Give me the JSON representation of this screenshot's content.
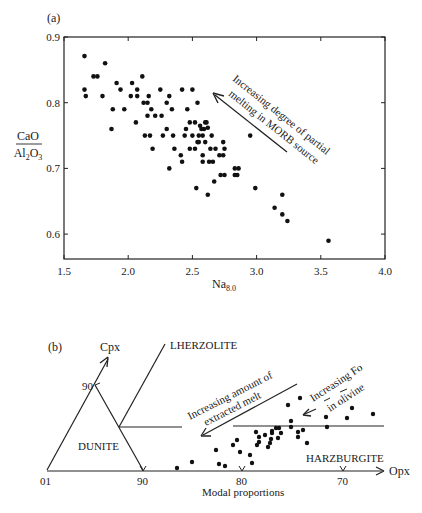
{
  "chart_data": [
    {
      "panel": "(a)",
      "type": "scatter",
      "title": "",
      "xlabel": "Na8.0",
      "xlabel_main": "Na",
      "xlabel_sub": "8.0",
      "ylabel": "CaO/Al2O3",
      "ylabel_num": "CaO",
      "ylabel_den_main": "Al",
      "ylabel_den_sub1": "2",
      "ylabel_den_mid": "O",
      "ylabel_den_sub2": "3",
      "xlim": [
        1.5,
        4.0
      ],
      "ylim": [
        0.56,
        0.9
      ],
      "xticks": [
        "1.5",
        "2.0",
        "2.5",
        "3.0",
        "3.5",
        "4.0"
      ],
      "yticks": [
        "0.9",
        "0.8",
        "0.7",
        "0.6"
      ],
      "grid": false,
      "annotation": {
        "line1": "Increasing degree of partial",
        "line2": "melting in MORB source",
        "arrow_direction": "up-left"
      },
      "points": [
        [
          1.66,
          0.871
        ],
        [
          1.66,
          0.82
        ],
        [
          1.67,
          0.81
        ],
        [
          1.82,
          0.86
        ],
        [
          1.73,
          0.84
        ],
        [
          1.76,
          0.84
        ],
        [
          1.8,
          0.81
        ],
        [
          1.88,
          0.79
        ],
        [
          1.87,
          0.76
        ],
        [
          1.91,
          0.83
        ],
        [
          1.94,
          0.82
        ],
        [
          1.97,
          0.79
        ],
        [
          2.02,
          0.81
        ],
        [
          2.03,
          0.83
        ],
        [
          2.07,
          0.82
        ],
        [
          2.07,
          0.81
        ],
        [
          2.11,
          0.84
        ],
        [
          2.12,
          0.8
        ],
        [
          2.06,
          0.77
        ],
        [
          2.15,
          0.8
        ],
        [
          2.16,
          0.81
        ],
        [
          2.18,
          0.79
        ],
        [
          2.15,
          0.78
        ],
        [
          2.21,
          0.78
        ],
        [
          2.25,
          0.82
        ],
        [
          2.26,
          0.78
        ],
        [
          2.3,
          0.8
        ],
        [
          2.32,
          0.81
        ],
        [
          2.34,
          0.79
        ],
        [
          2.13,
          0.75
        ],
        [
          2.17,
          0.75
        ],
        [
          2.19,
          0.73
        ],
        [
          2.27,
          0.75
        ],
        [
          2.3,
          0.76
        ],
        [
          2.35,
          0.75
        ],
        [
          2.36,
          0.73
        ],
        [
          2.42,
          0.82
        ],
        [
          2.41,
          0.72
        ],
        [
          2.46,
          0.79
        ],
        [
          2.45,
          0.76
        ],
        [
          2.44,
          0.75
        ],
        [
          2.48,
          0.77
        ],
        [
          2.5,
          0.82
        ],
        [
          2.54,
          0.8
        ],
        [
          2.32,
          0.7
        ],
        [
          2.42,
          0.71
        ],
        [
          2.58,
          0.71
        ],
        [
          2.63,
          0.71
        ],
        [
          2.53,
          0.67
        ],
        [
          2.62,
          0.66
        ],
        [
          2.5,
          0.75
        ],
        [
          2.52,
          0.77
        ],
        [
          2.55,
          0.74
        ],
        [
          2.57,
          0.76
        ],
        [
          2.55,
          0.75
        ],
        [
          2.58,
          0.75
        ],
        [
          2.6,
          0.74
        ],
        [
          2.48,
          0.73
        ],
        [
          2.52,
          0.73
        ],
        [
          2.58,
          0.72
        ],
        [
          2.54,
          0.74
        ],
        [
          2.56,
          0.765
        ],
        [
          2.6,
          0.77
        ],
        [
          2.62,
          0.762
        ],
        [
          2.59,
          0.76
        ],
        [
          2.61,
          0.77
        ],
        [
          2.65,
          0.75
        ],
        [
          2.74,
          0.74
        ],
        [
          2.75,
          0.73
        ],
        [
          2.64,
          0.73
        ],
        [
          2.68,
          0.73
        ],
        [
          2.71,
          0.72
        ],
        [
          2.74,
          0.72
        ],
        [
          2.66,
          0.71
        ],
        [
          2.83,
          0.7
        ],
        [
          2.86,
          0.7
        ],
        [
          2.83,
          0.69
        ],
        [
          2.85,
          0.69
        ],
        [
          2.72,
          0.69
        ],
        [
          2.75,
          0.69
        ],
        [
          2.67,
          0.68
        ],
        [
          2.95,
          0.75
        ],
        [
          2.99,
          0.67
        ],
        [
          3.2,
          0.66
        ],
        [
          3.14,
          0.64
        ],
        [
          3.2,
          0.63
        ],
        [
          3.24,
          0.62
        ],
        [
          3.56,
          0.59
        ]
      ]
    },
    {
      "panel": "(b)",
      "type": "scatter",
      "title": "",
      "xlabel": "Modal proportions",
      "axis_label_x": "Opx",
      "axis_label_y": "Cpx",
      "origin_label": "01",
      "base_ticks": [
        "90",
        "80",
        "70"
      ],
      "cpx_tick": "90",
      "fields": [
        "LHERZOLITE",
        "DUNITE",
        "HARZBURGITE"
      ],
      "annotations": {
        "melt_line1": "Increasing amount of",
        "melt_line2": "extracted melt",
        "fo_line1": "Increasing Fo",
        "fo_line2": "in olivine"
      },
      "points_px": [
        [
          177,
          468
        ],
        [
          192,
          462
        ],
        [
          216,
          450
        ],
        [
          219,
          464
        ],
        [
          225,
          466
        ],
        [
          233,
          445
        ],
        [
          237,
          440
        ],
        [
          240,
          452
        ],
        [
          250,
          455
        ],
        [
          252,
          463
        ],
        [
          256,
          432
        ],
        [
          259,
          437
        ],
        [
          257,
          445
        ],
        [
          259,
          442
        ],
        [
          265,
          435
        ],
        [
          268,
          447
        ],
        [
          270,
          443
        ],
        [
          271,
          439
        ],
        [
          272,
          431
        ],
        [
          272,
          433
        ],
        [
          276,
          428
        ],
        [
          279,
          428
        ],
        [
          278,
          438
        ],
        [
          281,
          433
        ],
        [
          288,
          405
        ],
        [
          291,
          421
        ],
        [
          291,
          427
        ],
        [
          298,
          432
        ],
        [
          298,
          437
        ],
        [
          300,
          398
        ],
        [
          303,
          430
        ],
        [
          307,
          443
        ],
        [
          326,
          417
        ],
        [
          327,
          427
        ],
        [
          347,
          418
        ],
        [
          352,
          408
        ],
        [
          373,
          414
        ]
      ]
    }
  ]
}
